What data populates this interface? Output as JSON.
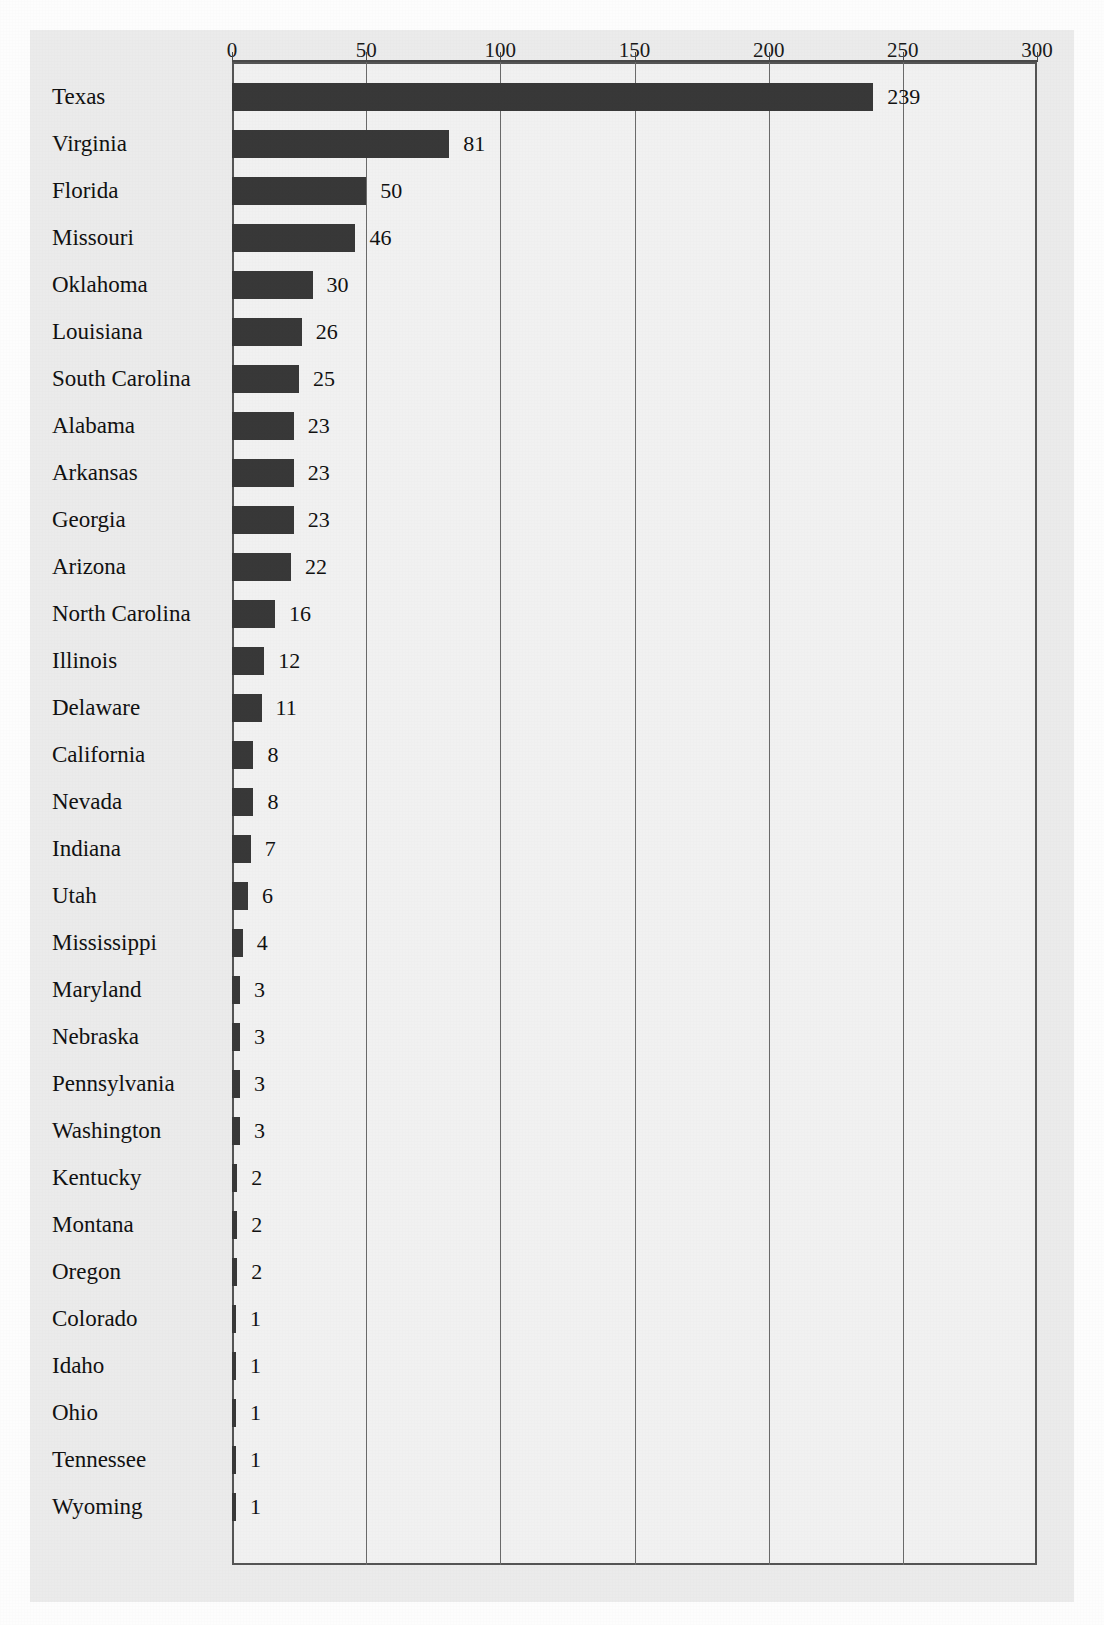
{
  "chart_data": {
    "type": "bar",
    "orientation": "horizontal",
    "title": "",
    "subtitle": "",
    "xlabel": "",
    "ylabel": "",
    "xlim": [
      0,
      300
    ],
    "grid": true,
    "legend": null,
    "tick_labels": [
      "0",
      "50",
      "100",
      "150",
      "200",
      "250",
      "300"
    ],
    "ticks": [
      0,
      50,
      100,
      150,
      200,
      250,
      300
    ],
    "categories": [
      "Texas",
      "Virginia",
      "Florida",
      "Missouri",
      "Oklahoma",
      "Louisiana",
      "South Carolina",
      "Alabama",
      "Arkansas",
      "Georgia",
      "Arizona",
      "North Carolina",
      "Illinois",
      "Delaware",
      "California",
      "Nevada",
      "Indiana",
      "Utah",
      "Mississippi",
      "Maryland",
      "Nebraska",
      "Pennsylvania",
      "Washington",
      "Kentucky",
      "Montana",
      "Oregon",
      "Colorado",
      "Idaho",
      "Ohio",
      "Tennessee",
      "Wyoming"
    ],
    "values": [
      239,
      81,
      50,
      46,
      30,
      26,
      25,
      23,
      23,
      23,
      22,
      16,
      12,
      11,
      8,
      8,
      7,
      6,
      4,
      3,
      3,
      3,
      3,
      2,
      2,
      2,
      1,
      1,
      1,
      1,
      1
    ],
    "value_labels": [
      "239",
      "81",
      "50",
      "46",
      "30",
      "26",
      "25",
      "23",
      "23",
      "23",
      "22",
      "16",
      "12",
      "11",
      "8",
      "8",
      "7",
      "6",
      "4",
      "3",
      "3",
      "3",
      "3",
      "2",
      "2",
      "2",
      "1",
      "1",
      "1",
      "1",
      "1"
    ],
    "bar_color": "#383838",
    "plot_background": "#f1f1f1",
    "page_background": "#ebebeb",
    "axis_color": "#555555"
  }
}
